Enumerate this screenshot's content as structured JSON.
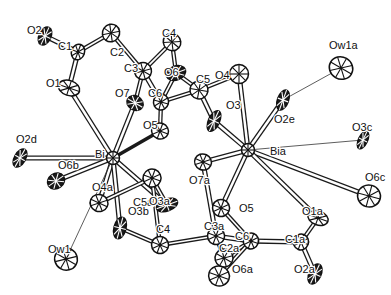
{
  "figure": {
    "type": "crystal-structure-thermal-ellipsoid-plot",
    "width": 391,
    "height": 295,
    "background_color": "#ffffff",
    "line_color": "#111111"
  },
  "atoms": [
    {
      "id": "O2",
      "label": "O2",
      "x": 45,
      "y": 36,
      "ax": 27,
      "ay": 31,
      "rx": 6.0,
      "ry": 9.5,
      "rot": 25,
      "kind": "oxygen",
      "shade": "dark"
    },
    {
      "id": "C1",
      "label": "C1",
      "x": 78,
      "y": 52,
      "ax": 58,
      "ay": 47,
      "rx": 6.5,
      "ry": 8.0,
      "rot": 20,
      "kind": "carbon",
      "shade": "open"
    },
    {
      "id": "C2",
      "label": "C2",
      "x": 111,
      "y": 33,
      "ax": 110,
      "ay": 53,
      "rx": 8.5,
      "ry": 9.0,
      "rot": 35,
      "kind": "carbon",
      "shade": "open"
    },
    {
      "id": "O1",
      "label": "O1",
      "x": 69,
      "y": 88,
      "ax": 46,
      "ay": 84,
      "rx": 11.0,
      "ry": 7.5,
      "rot": 18,
      "kind": "oxygen",
      "shade": "open"
    },
    {
      "id": "C3",
      "label": "C3",
      "x": 143,
      "y": 71,
      "ax": 124,
      "ay": 69,
      "rx": 8.5,
      "ry": 8.5,
      "rot": 30,
      "kind": "carbon",
      "shade": "open"
    },
    {
      "id": "C4",
      "label": "C4",
      "x": 172,
      "y": 42,
      "ax": 162,
      "ay": 34,
      "rx": 9.0,
      "ry": 8.5,
      "rot": 40,
      "kind": "carbon",
      "shade": "open"
    },
    {
      "id": "O6",
      "label": "O6",
      "x": 176,
      "y": 73,
      "ax": 164,
      "ay": 73,
      "rx": 7.0,
      "ry": 10.0,
      "rot": 70,
      "kind": "oxygen",
      "shade": "dark"
    },
    {
      "id": "C5",
      "label": "C5",
      "x": 199,
      "y": 90,
      "ax": 196,
      "ay": 80,
      "rx": 9.0,
      "ry": 9.0,
      "rot": 10,
      "kind": "carbon",
      "shade": "open"
    },
    {
      "id": "O4",
      "label": "O4",
      "x": 239,
      "y": 74,
      "ax": 215,
      "ay": 76,
      "rx": 9.5,
      "ry": 9.5,
      "rot": 0,
      "kind": "oxygen",
      "shade": "open"
    },
    {
      "id": "C6",
      "label": "C6",
      "x": 161,
      "y": 102,
      "ax": 148,
      "ay": 94,
      "rx": 7.5,
      "ry": 8.0,
      "rot": 15,
      "kind": "carbon",
      "shade": "open"
    },
    {
      "id": "O7",
      "label": "O7",
      "x": 135,
      "y": 103,
      "ax": 115,
      "ay": 94,
      "rx": 8.5,
      "ry": 7.0,
      "rot": 30,
      "kind": "oxygen",
      "shade": "dark"
    },
    {
      "id": "O3",
      "label": "O3",
      "x": 214,
      "y": 121,
      "ax": 226,
      "ay": 106,
      "rx": 5.5,
      "ry": 11.0,
      "rot": 25,
      "kind": "oxygen",
      "shade": "dark"
    },
    {
      "id": "O5",
      "label": "O5",
      "x": 160,
      "y": 131,
      "ax": 143,
      "ay": 126,
      "rx": 8.5,
      "ry": 8.0,
      "rot": 20,
      "kind": "oxygen",
      "shade": "open"
    },
    {
      "id": "Ow1a",
      "label": "Ow1a",
      "x": 341,
      "y": 68,
      "ax": 329,
      "ay": 46,
      "rx": 12.0,
      "ry": 11.0,
      "rot": 30,
      "kind": "water",
      "shade": "open"
    },
    {
      "id": "O2e",
      "label": "O2e",
      "x": 283,
      "y": 100,
      "ax": 274,
      "ay": 120,
      "rx": 5.5,
      "ry": 10.5,
      "rot": 20,
      "kind": "oxygen",
      "shade": "dark"
    },
    {
      "id": "O3c",
      "label": "O3c",
      "x": 363,
      "y": 140,
      "ax": 352,
      "ay": 128,
      "rx": 4.5,
      "ry": 9.5,
      "rot": 25,
      "kind": "oxygen",
      "shade": "dark"
    },
    {
      "id": "O6c",
      "label": "O6c",
      "x": 369,
      "y": 196,
      "ax": 365,
      "ay": 178,
      "rx": 11.5,
      "ry": 11.0,
      "rot": 15,
      "kind": "oxygen",
      "shade": "open"
    },
    {
      "id": "O2d",
      "label": "O2d",
      "x": 20,
      "y": 158,
      "ax": 16,
      "ay": 140,
      "rx": 5.5,
      "ry": 10.0,
      "rot": 30,
      "kind": "oxygen",
      "shade": "dark"
    },
    {
      "id": "Bi",
      "label": "Bi",
      "x": 113,
      "y": 158,
      "ax": 95,
      "ay": 155,
      "rx": 6.5,
      "ry": 6.5,
      "rot": 0,
      "kind": "bismuth",
      "shade": "open"
    },
    {
      "id": "O6b",
      "label": "O6b",
      "x": 56,
      "y": 181,
      "ax": 58,
      "ay": 166,
      "rx": 7.5,
      "ry": 9.0,
      "rot": 55,
      "kind": "oxygen",
      "shade": "dark"
    },
    {
      "id": "O4a",
      "label": "O4a",
      "x": 99,
      "y": 203,
      "ax": 92,
      "ay": 188,
      "rx": 9.0,
      "ry": 8.5,
      "rot": 25,
      "kind": "oxygen",
      "shade": "open"
    },
    {
      "id": "C5a",
      "label": "C5a",
      "x": 152,
      "y": 178,
      "ax": 133,
      "ay": 203,
      "rx": 9.0,
      "ry": 9.0,
      "rot": 20,
      "kind": "carbon",
      "shade": "open"
    },
    {
      "id": "O3a",
      "label": "O3a",
      "x": 167,
      "y": 205,
      "ax": 149,
      "ay": 202,
      "rx": 6.0,
      "ry": 11.0,
      "rot": 70,
      "kind": "oxygen",
      "shade": "dark"
    },
    {
      "id": "O3b",
      "label": "O3b",
      "x": 120,
      "y": 228,
      "ax": 128,
      "ay": 212,
      "rx": 6.0,
      "ry": 11.0,
      "rot": 15,
      "kind": "oxygen",
      "shade": "dark"
    },
    {
      "id": "Ow1",
      "label": "Ow1",
      "x": 66,
      "y": 259,
      "ax": 48,
      "ay": 250,
      "rx": 11.5,
      "ry": 11.0,
      "rot": 30,
      "kind": "water",
      "shade": "open"
    },
    {
      "id": "C4b",
      "label": "C4",
      "x": 160,
      "y": 245,
      "ax": 156,
      "ay": 230,
      "rx": 8.5,
      "ry": 8.5,
      "rot": 20,
      "kind": "carbon",
      "shade": "open"
    },
    {
      "id": "Bia",
      "label": "Bia",
      "x": 248,
      "y": 150,
      "ax": 270,
      "ay": 152,
      "rx": 6.5,
      "ry": 6.5,
      "rot": 0,
      "kind": "bismuth",
      "shade": "open"
    },
    {
      "id": "O7a",
      "label": "O7a",
      "x": 203,
      "y": 162,
      "ax": 189,
      "ay": 181,
      "rx": 8.5,
      "ry": 8.0,
      "rot": 25,
      "kind": "oxygen",
      "shade": "open"
    },
    {
      "id": "O5a",
      "label": "O5",
      "x": 221,
      "y": 208,
      "ax": 239,
      "ay": 209,
      "rx": 8.5,
      "ry": 8.5,
      "rot": 20,
      "kind": "oxygen",
      "shade": "open"
    },
    {
      "id": "O1a",
      "label": "O1a",
      "x": 318,
      "y": 218,
      "ax": 302,
      "ay": 212,
      "rx": 10.5,
      "ry": 7.0,
      "rot": 20,
      "kind": "oxygen",
      "shade": "open"
    },
    {
      "id": "C3a",
      "label": "C3a",
      "x": 216,
      "y": 236,
      "ax": 204,
      "ay": 227,
      "rx": 8.5,
      "ry": 8.5,
      "rot": 20,
      "kind": "carbon",
      "shade": "open"
    },
    {
      "id": "C6a",
      "label": "C6",
      "x": 251,
      "y": 241,
      "ax": 235,
      "ay": 237,
      "rx": 7.5,
      "ry": 8.0,
      "rot": 20,
      "kind": "carbon",
      "shade": "open"
    },
    {
      "id": "C1a",
      "label": "C1a",
      "x": 301,
      "y": 242,
      "ax": 285,
      "ay": 240,
      "rx": 7.5,
      "ry": 8.0,
      "rot": 20,
      "kind": "carbon",
      "shade": "open"
    },
    {
      "id": "C2a",
      "label": "C2a",
      "x": 224,
      "y": 258,
      "ax": 219,
      "ay": 249,
      "rx": 9.0,
      "ry": 9.0,
      "rot": 30,
      "kind": "carbon",
      "shade": "open"
    },
    {
      "id": "O6a",
      "label": "O6a",
      "x": 219,
      "y": 276,
      "ax": 232,
      "ay": 270,
      "rx": 10.5,
      "ry": 10.0,
      "rot": 20,
      "kind": "oxygen",
      "shade": "open"
    },
    {
      "id": "O2a",
      "label": "O2a",
      "x": 315,
      "y": 274,
      "ax": 294,
      "ay": 270,
      "rx": 6.0,
      "ry": 10.5,
      "rot": 25,
      "kind": "oxygen",
      "shade": "dark"
    }
  ],
  "bonds": [
    {
      "from": "O2",
      "to": "C1",
      "style": "double"
    },
    {
      "from": "C1",
      "to": "C2",
      "style": "single"
    },
    {
      "from": "C1",
      "to": "O1",
      "style": "double"
    },
    {
      "from": "C2",
      "to": "C3",
      "style": "single"
    },
    {
      "from": "C3",
      "to": "C4",
      "style": "single"
    },
    {
      "from": "C3",
      "to": "O7",
      "style": "single"
    },
    {
      "from": "C3",
      "to": "C6",
      "style": "double"
    },
    {
      "from": "C4",
      "to": "O6",
      "style": "single"
    },
    {
      "from": "O6",
      "to": "C6",
      "style": "single"
    },
    {
      "from": "O6",
      "to": "C5",
      "style": "single"
    },
    {
      "from": "C6",
      "to": "C5",
      "style": "single"
    },
    {
      "from": "C6",
      "to": "O5",
      "style": "single"
    },
    {
      "from": "C5",
      "to": "O4",
      "style": "single"
    },
    {
      "from": "C5",
      "to": "O3",
      "style": "double"
    },
    {
      "from": "O1",
      "to": "Bi",
      "style": "double"
    },
    {
      "from": "O7",
      "to": "Bi",
      "style": "double"
    },
    {
      "from": "O5",
      "to": "Bi",
      "style": "thick"
    },
    {
      "from": "O2d",
      "to": "Bi",
      "style": "double"
    },
    {
      "from": "O6b",
      "to": "Bi",
      "style": "double"
    },
    {
      "from": "O4a",
      "to": "Bi",
      "style": "double"
    },
    {
      "from": "O3a",
      "to": "Bi",
      "style": "double"
    },
    {
      "from": "O3b",
      "to": "Bi",
      "style": "double"
    },
    {
      "from": "Ow1",
      "to": "Bi",
      "style": "thin"
    },
    {
      "from": "O4",
      "to": "Bia",
      "style": "double"
    },
    {
      "from": "O3",
      "to": "Bia",
      "style": "double"
    },
    {
      "from": "O2e",
      "to": "Bia",
      "style": "double"
    },
    {
      "from": "O2e",
      "to": "Ow1a",
      "style": "thin"
    },
    {
      "from": "O3c",
      "to": "Bia",
      "style": "thin"
    },
    {
      "from": "O6c",
      "to": "Bia",
      "style": "double"
    },
    {
      "from": "O7a",
      "to": "Bia",
      "style": "double"
    },
    {
      "from": "O5a",
      "to": "Bia",
      "style": "double"
    },
    {
      "from": "O1a",
      "to": "Bia",
      "style": "double"
    },
    {
      "from": "O7a",
      "to": "C3a",
      "style": "double"
    },
    {
      "from": "O5a",
      "to": "C6a",
      "style": "single"
    },
    {
      "from": "C3a",
      "to": "C6a",
      "style": "double"
    },
    {
      "from": "C3a",
      "to": "C2a",
      "style": "single"
    },
    {
      "from": "C3a",
      "to": "C4b",
      "style": "single"
    },
    {
      "from": "C6a",
      "to": "C2a",
      "style": "single"
    },
    {
      "from": "C6a",
      "to": "C1a",
      "style": "double"
    },
    {
      "from": "C2a",
      "to": "O6a",
      "style": "single"
    },
    {
      "from": "O6a",
      "to": "C6a",
      "style": "single"
    },
    {
      "from": "C1a",
      "to": "O1a",
      "style": "single"
    },
    {
      "from": "C1a",
      "to": "O2a",
      "style": "double"
    },
    {
      "from": "C4b",
      "to": "O3b",
      "style": "single"
    },
    {
      "from": "C4b",
      "to": "C5a",
      "style": "single"
    },
    {
      "from": "C5a",
      "to": "O3a",
      "style": "single"
    },
    {
      "from": "C5a",
      "to": "O4a",
      "style": "single"
    }
  ],
  "metal_centers": [
    "Bi",
    "Bia"
  ],
  "legend": {
    "note": "Thermal ellipsoids shown at probability level; hydrogen atoms omitted"
  }
}
